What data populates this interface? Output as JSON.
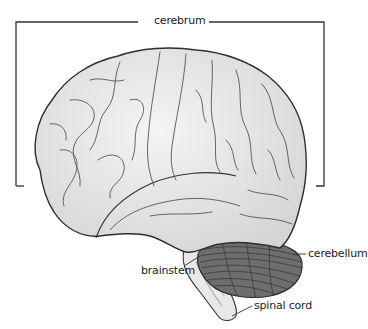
{
  "diagram": {
    "type": "labeled anatomical diagram",
    "labels": {
      "cerebrum": "cerebrum",
      "cerebellum": "cerebellum",
      "brainstem": "brainstem",
      "spinal_cord": "spinal cord"
    },
    "colors": {
      "cerebrum_fill": "#e6e6e6",
      "cerebellum_fill": "#6e6e6e",
      "outline": "#333333",
      "leader_line": "#333333"
    }
  }
}
